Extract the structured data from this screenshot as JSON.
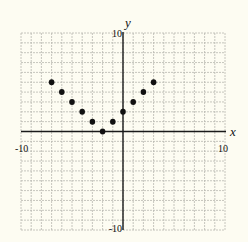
{
  "chart_data": {
    "type": "scatter",
    "title": "",
    "xlabel": "x",
    "ylabel": "y",
    "xlim": [
      -10,
      10
    ],
    "ylim": [
      -10,
      10
    ],
    "grid": true,
    "grid_step": 1,
    "tick_labels": {
      "x_min": "-10",
      "x_max": "10",
      "y_min": "-10",
      "y_max": "10"
    },
    "series": [
      {
        "name": "points",
        "points": [
          {
            "x": -7,
            "y": 5
          },
          {
            "x": -6,
            "y": 4
          },
          {
            "x": -5,
            "y": 3
          },
          {
            "x": -4,
            "y": 2
          },
          {
            "x": -3,
            "y": 1
          },
          {
            "x": -2,
            "y": 0
          },
          {
            "x": -1,
            "y": 1
          },
          {
            "x": 0,
            "y": 2
          },
          {
            "x": 1,
            "y": 3
          },
          {
            "x": 2,
            "y": 4
          },
          {
            "x": 3,
            "y": 5
          }
        ]
      }
    ],
    "legend": null
  },
  "colors": {
    "background": "#fdfcf2",
    "grid": "#b8b8b0",
    "axis": "#1a1a1a",
    "point": "#111111"
  }
}
